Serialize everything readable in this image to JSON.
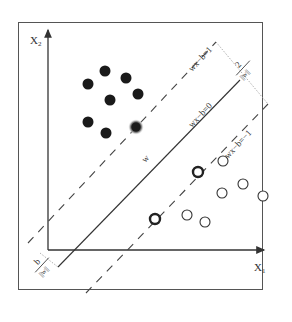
{
  "diagram": {
    "axes": {
      "x_label": "X",
      "x_sub": "1",
      "y_label": "X",
      "y_sub": "2"
    },
    "lines": {
      "hyperplane_label": "wx−b=0",
      "upper_margin_label": "wx−b=1",
      "lower_margin_label": "wx−b=−1",
      "normal_vector_label": "w"
    },
    "annotations": {
      "margin_numerator": "2",
      "margin_denominator": "||w||",
      "offset_numerator": "b",
      "offset_denominator": "||w||"
    },
    "classes": {
      "positive": {
        "style": "filled",
        "color": "#1a1a1a",
        "points": [
          [
            88,
            84
          ],
          [
            105,
            71
          ],
          [
            126,
            78
          ],
          [
            138,
            94
          ],
          [
            110,
            100
          ],
          [
            88,
            122
          ],
          [
            106,
            133
          ]
        ],
        "support_vectors": [
          [
            136,
            127
          ]
        ]
      },
      "negative": {
        "style": "open",
        "color": "#333333",
        "points": [
          [
            223,
            161
          ],
          [
            198,
            172
          ],
          [
            243,
            184
          ],
          [
            222,
            193
          ],
          [
            263,
            196
          ],
          [
            187,
            215
          ],
          [
            205,
            222
          ]
        ],
        "support_vectors": [
          [
            155,
            219
          ]
        ]
      }
    },
    "colors": {
      "stroke": "#333333",
      "guide": "#9a9a9a"
    }
  }
}
